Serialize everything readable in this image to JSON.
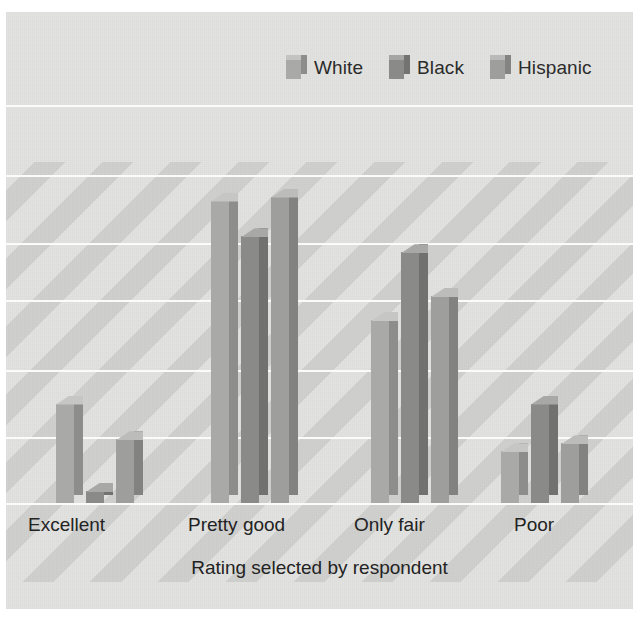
{
  "chart_data": {
    "type": "bar",
    "title": "",
    "subtitle": "",
    "xlabel": "Rating selected by respondent",
    "ylabel": "",
    "categories": [
      "Excellent",
      "Pretty good",
      "Only fair",
      "Poor"
    ],
    "series": [
      {
        "name": "White",
        "color": "#a9a9a7",
        "values": [
          25,
          76,
          46,
          13
        ]
      },
      {
        "name": "Black",
        "color": "#8a8a88",
        "values": [
          3,
          67,
          63,
          25
        ]
      },
      {
        "name": "Hispanic",
        "color": "#9e9e9c",
        "values": [
          16,
          77,
          52,
          15
        ]
      }
    ],
    "ylim": [
      0,
      100
    ],
    "grid": true,
    "gridline_count": 7,
    "legend_position": "top-right",
    "style": "3d-column",
    "background_color": "#e2e2e0",
    "gridline_color": "#fbfbfa",
    "text_color": "#232323"
  },
  "legend": {
    "entries": [
      {
        "label": "White"
      },
      {
        "label": "Black"
      },
      {
        "label": "Hispanic"
      }
    ]
  },
  "axis": {
    "title": "Rating selected by respondent",
    "ticks": [
      "Excellent",
      "Pretty good",
      "Only fair",
      "Poor"
    ]
  }
}
